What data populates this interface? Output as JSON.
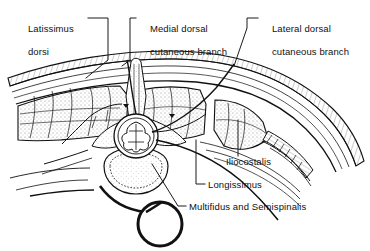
{
  "figure": {
    "kind": "anatomical-cross-section",
    "title_visible": false,
    "colors": {
      "background": "#ffffff",
      "ink": "#111111",
      "leader": "#1a1a1a",
      "muscle_fill": "#f2f2f2",
      "bone_fill": "#fafafa"
    }
  },
  "labels": {
    "latissimus_dorsi": {
      "line1": "Latissimus",
      "line2": "dorsi",
      "name": "Latissimus dorsi"
    },
    "medial_dorsal": {
      "line1": "Medial dorsal",
      "line2": "cutaneous branch",
      "name": "Medial dorsal cutaneous branch"
    },
    "lateral_dorsal": {
      "line1": "Lateral dorsal",
      "line2": "cutaneous branch",
      "name": "Lateral dorsal cutaneous branch"
    },
    "iliocostalis": {
      "text": "Iliocostalis"
    },
    "longissimus": {
      "text": "Longissimus"
    },
    "multifidus": {
      "text": "Multifidus and Semispinalis"
    }
  },
  "structures": [
    {
      "id": "skin-fascia",
      "label": "skin and superficial fascia layers"
    },
    {
      "id": "latissimus-dorsi-muscle",
      "label": "Latissimus dorsi"
    },
    {
      "id": "iliocostalis-muscle",
      "label": "Iliocostalis"
    },
    {
      "id": "longissimus-muscle",
      "label": "Longissimus"
    },
    {
      "id": "multifidus-semispinalis",
      "label": "Multifidus and Semispinalis"
    },
    {
      "id": "vertebra",
      "label": "vertebra"
    },
    {
      "id": "spinal-cord",
      "label": "spinal cord"
    },
    {
      "id": "rib",
      "label": "rib"
    },
    {
      "id": "nerve-loop",
      "label": "intercostal nerve loop"
    }
  ]
}
